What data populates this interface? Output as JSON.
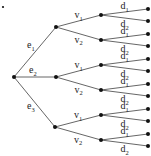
{
  "diagram": {
    "type": "tree",
    "root": {
      "id": "root",
      "x": 14,
      "y": 77
    },
    "stray_dot": {
      "x": 3,
      "y": 7
    },
    "level1": [
      {
        "id": "e1",
        "base": "e",
        "sub": "1",
        "x": 56,
        "y": 27,
        "lx": 27,
        "ly": 48
      },
      {
        "id": "e2",
        "base": "e",
        "sub": "2",
        "x": 56,
        "y": 77,
        "lx": 29,
        "ly": 73
      },
      {
        "id": "e3",
        "base": "e",
        "sub": "3",
        "x": 55,
        "y": 127,
        "lx": 27,
        "ly": 109
      }
    ],
    "level2_labels": [
      {
        "base": "v",
        "sub": "1"
      },
      {
        "base": "v",
        "sub": "2"
      }
    ],
    "level3_labels": [
      {
        "base": "d",
        "sub": "1"
      },
      {
        "base": "d",
        "sub": "2"
      }
    ],
    "level2": [
      {
        "parent": "e1",
        "label": 0,
        "x": 101,
        "y": 15
      },
      {
        "parent": "e1",
        "label": 1,
        "x": 101,
        "y": 40
      },
      {
        "parent": "e2",
        "label": 0,
        "x": 101,
        "y": 65
      },
      {
        "parent": "e2",
        "label": 1,
        "x": 101,
        "y": 90
      },
      {
        "parent": "e3",
        "label": 0,
        "x": 101,
        "y": 115
      },
      {
        "parent": "e3",
        "label": 1,
        "x": 101,
        "y": 140
      }
    ],
    "leaf_x": 148,
    "leaf_offsets": [
      -6,
      6
    ]
  }
}
